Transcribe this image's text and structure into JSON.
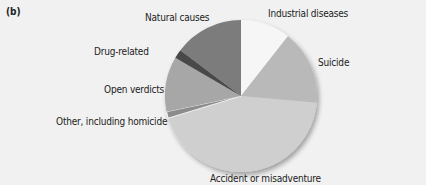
{
  "panel_label": "(b)",
  "chart_data": {
    "type": "pie",
    "title": "",
    "start_angle_deg": 0,
    "direction": "clockwise",
    "slices": [
      {
        "label": "Industrial diseases",
        "value": 10.6,
        "color": "#f6f6f6"
      },
      {
        "label": "Suicide",
        "value": 15.8,
        "color": "#b9b9b9"
      },
      {
        "label": "Accident or misadventure",
        "value": 43.9,
        "color": "#cfcfcf"
      },
      {
        "label": "Other, including homicide",
        "value": 1.4,
        "color": "#8c8c8c"
      },
      {
        "label": "Open verdicts",
        "value": 11.7,
        "color": "#a7a7a7"
      },
      {
        "label": "Drug-related",
        "value": 1.9,
        "color": "#4a4a4a"
      },
      {
        "label": "Natural causes",
        "value": 14.7,
        "color": "#7b7b7b"
      }
    ],
    "legend": "none (direct labels)"
  },
  "labels": {
    "industrial": "Industrial diseases",
    "suicide": "Suicide",
    "accident": "Accident or misadventure",
    "other": "Other, including homicide",
    "open": "Open verdicts",
    "drug": "Drug-related",
    "natural": "Natural causes"
  }
}
